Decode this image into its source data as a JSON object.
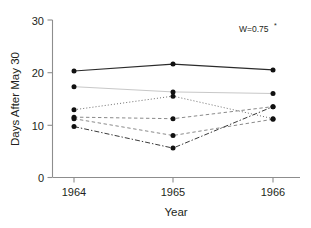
{
  "chart_data": {
    "type": "line",
    "title": "",
    "xlabel": "Year",
    "ylabel": "Days After May 30",
    "categories": [
      "1964",
      "1965",
      "1966"
    ],
    "x": [
      1964,
      1965,
      1966
    ],
    "xlim": [
      1963.5,
      1966.5
    ],
    "ylim": [
      0,
      30
    ],
    "yticks": [
      0,
      10,
      20,
      30
    ],
    "ytick_labels": [
      "0",
      "10",
      "20",
      "30"
    ],
    "xtick_labels": [
      "1964",
      "1965",
      "1966"
    ],
    "grid": false,
    "legend": "none",
    "annotations": [
      {
        "name": "kendall-w-statistic",
        "text": "W=0.75",
        "superscript": "*",
        "x": 1966.2,
        "y": 28.5
      }
    ],
    "series": [
      {
        "name": "series-1",
        "linestyle": "solid",
        "color": "#2b2b2b",
        "width": 1.1,
        "values": [
          20.3,
          21.6,
          20.5
        ]
      },
      {
        "name": "series-2",
        "linestyle": "solid-faint",
        "color": "#c8c8c8",
        "width": 1.0,
        "values": [
          17.3,
          16.3,
          16.0
        ]
      },
      {
        "name": "series-3",
        "linestyle": "dotted",
        "color": "#6e6e6e",
        "width": 1.0,
        "values": [
          12.9,
          15.5,
          11.2
        ]
      },
      {
        "name": "series-4",
        "linestyle": "dashed",
        "color": "#8a8a8a",
        "width": 1.0,
        "values": [
          11.5,
          11.2,
          13.5
        ]
      },
      {
        "name": "series-5",
        "linestyle": "dashed",
        "color": "#8a8a8a",
        "width": 1.0,
        "values": [
          11.2,
          8.0,
          11.1
        ]
      },
      {
        "name": "series-6",
        "linestyle": "dashdot",
        "color": "#3a3a3a",
        "width": 1.0,
        "values": [
          9.7,
          5.6,
          13.5
        ]
      }
    ]
  },
  "axes": {
    "y_title": "Days After May 30",
    "x_title": "Year"
  },
  "ticks": {
    "y": [
      "30",
      "20",
      "10",
      "0"
    ],
    "x": [
      "1964",
      "1965",
      "1966"
    ]
  },
  "annotation": {
    "label": "W=0.75",
    "star": "*"
  }
}
